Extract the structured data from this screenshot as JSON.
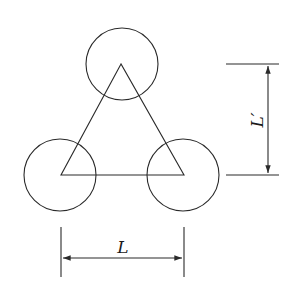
{
  "diagram": {
    "labels": {
      "horizontal_dimension": "L",
      "vertical_dimension": "L′"
    },
    "shapes": {
      "circles": [
        {
          "name": "top",
          "cx": 122,
          "cy": 64,
          "r": 36
        },
        {
          "name": "bottom-left",
          "cx": 60,
          "cy": 175,
          "r": 36
        },
        {
          "name": "bottom-right",
          "cx": 183,
          "cy": 175,
          "r": 36
        }
      ],
      "triangle_vertices": [
        [
          121,
          64
        ],
        [
          61,
          175
        ],
        [
          184,
          175
        ]
      ]
    },
    "colors": {
      "line": "#2a2a2a",
      "background": "#ffffff"
    }
  }
}
